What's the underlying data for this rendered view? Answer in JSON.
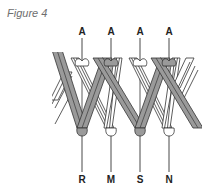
{
  "caption": "Figure 4",
  "top_labels": [
    "A",
    "A",
    "A",
    "A"
  ],
  "bottom_labels": [
    "R",
    "M",
    "S",
    "N"
  ],
  "colors": {
    "dark_strand": "#9a9a9a",
    "light_strand": "#ffffff",
    "outline": "#333333",
    "caption": "#6e6e6e"
  }
}
